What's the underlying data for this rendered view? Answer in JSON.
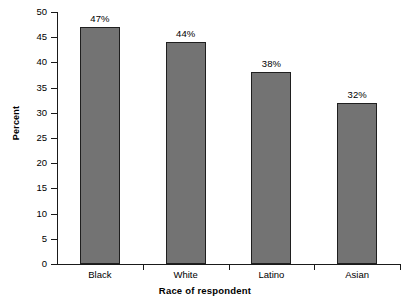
{
  "chart_data": {
    "type": "bar",
    "title": "",
    "subtitle": "",
    "xlabel": "Race of respondent",
    "ylabel": "Percent",
    "categories": [
      "Black",
      "White",
      "Latino",
      "Asian"
    ],
    "values": [
      47,
      44,
      38,
      32
    ],
    "data_labels": [
      "47%",
      "44%",
      "38%",
      "32%"
    ],
    "ylim": [
      0,
      50
    ],
    "ytick_values": [
      0,
      5,
      10,
      15,
      20,
      25,
      30,
      35,
      40,
      45,
      50
    ],
    "ytick_labels": [
      "0",
      "5",
      "10",
      "15",
      "20",
      "25",
      "30",
      "35",
      "40",
      "45",
      "50"
    ],
    "grid": false,
    "legend": null,
    "legend_position": "none",
    "bar_fill_color": "#737373",
    "bar_edge_color": "#1f1f1f",
    "axis_color": "#1a1a1a",
    "background_color": "#ffffff"
  }
}
